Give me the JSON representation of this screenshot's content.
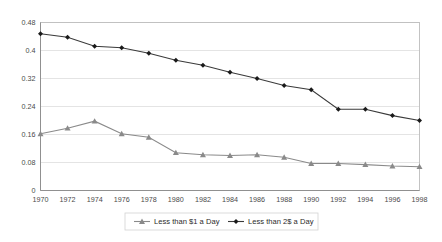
{
  "chart_data": {
    "type": "line",
    "title": "",
    "subtitle": "",
    "xlabel": "",
    "ylabel": "",
    "grid": true,
    "legend_position": "bottom",
    "x": [
      1970,
      1972,
      1974,
      1976,
      1978,
      1980,
      1982,
      1984,
      1986,
      1988,
      1990,
      1992,
      1994,
      1996,
      1998
    ],
    "categories": [
      "1970",
      "1972",
      "1974",
      "1976",
      "1978",
      "1980",
      "1982",
      "1984",
      "1986",
      "1988",
      "1990",
      "1992",
      "1994",
      "1996",
      "1998"
    ],
    "xlim": [
      1970,
      1998
    ],
    "ylim": [
      0,
      0.48
    ],
    "yticks": [
      0,
      0.08,
      0.16,
      0.24,
      0.32,
      0.4,
      0.48
    ],
    "ytick_labels": [
      "0",
      "0.08",
      "0.16",
      "0.24",
      "0.32",
      "0.4",
      "0.48"
    ],
    "series": [
      {
        "name": "Less than $1 a Day",
        "marker": "triangle",
        "color": "#8a8a8a",
        "values": [
          0.162,
          0.178,
          0.198,
          0.162,
          0.152,
          0.108,
          0.102,
          0.1,
          0.102,
          0.095,
          0.077,
          0.077,
          0.074,
          0.07,
          0.068
        ]
      },
      {
        "name": "Less than 2$ a Day",
        "marker": "diamond",
        "color": "#1a1a1a",
        "values": [
          0.448,
          0.438,
          0.412,
          0.408,
          0.392,
          0.372,
          0.358,
          0.338,
          0.32,
          0.3,
          0.288,
          0.232,
          0.232,
          0.214,
          0.2
        ]
      }
    ]
  },
  "legend": {
    "items": [
      {
        "label": "Less than $1 a Day"
      },
      {
        "label": "Less than 2$ a Day"
      }
    ]
  }
}
